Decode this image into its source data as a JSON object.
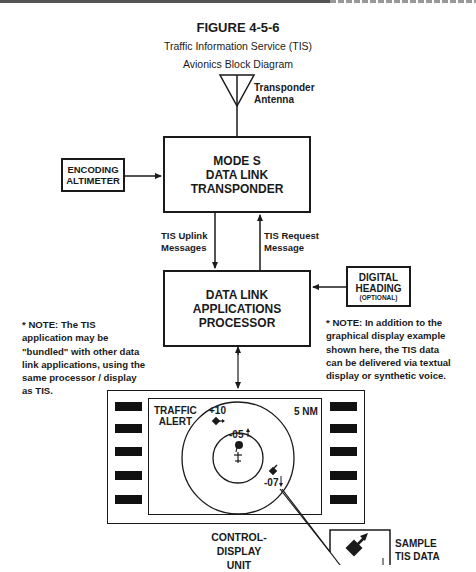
{
  "header": {
    "figure_number": "FIGURE 4-5-6",
    "subtitle_line1": "Traffic Information Service (TIS)",
    "subtitle_line2": "Avionics Block Diagram"
  },
  "antenna": {
    "label": "Transponder\nAntenna"
  },
  "blocks": {
    "encoding_altimeter": "ENCODING\nALTIMETER",
    "mode_s_transponder": "MODE S\nDATA LINK\nTRANSPONDER",
    "data_link_processor": "DATA LINK\nAPPLICATIONS\nPROCESSOR",
    "digital_heading": "DIGITAL\nHEADING",
    "digital_heading_note": "(OPTIONAL)",
    "control_display_unit": "CONTROL-\nDISPLAY\nUNIT"
  },
  "links": {
    "uplink": "TIS Uplink\nMessages",
    "request": "TIS Request\nMessage"
  },
  "notes": {
    "left": "* NOTE:  The TIS\napplication may be\n\"bundled\"  with other data\nlink applications,  using the\nsame processor / display\nas TIS.",
    "right": "* NOTE:  In addition to the\ngraphical display example\nshown here, the TIS data\ncan be delivered via textual\ndisplay or synthetic voice."
  },
  "display": {
    "alert_text": "TRAFFIC\nALERT",
    "range": "5 NM",
    "targets": [
      {
        "label": "+10",
        "trend": "level"
      },
      {
        "label": "-05",
        "trend": "climbing"
      },
      {
        "label": "-07",
        "trend": "descending"
      }
    ],
    "left_buttons": 5,
    "right_buttons": 5
  },
  "sample": {
    "label": "SAMPLE\nTIS DATA"
  },
  "colors": {
    "ink": "#1a1a1a",
    "background": "#ffffff"
  }
}
